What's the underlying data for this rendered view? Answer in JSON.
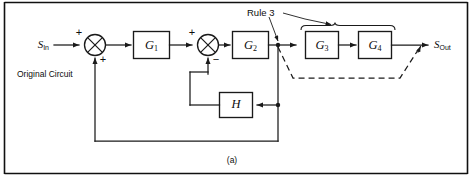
{
  "figure": {
    "caption": "(a)",
    "note": "Original Circuit",
    "annotation": "Rule 3",
    "input_signal": "S",
    "input_signal_sub": "In",
    "output_signal": "S",
    "output_signal_sub": "Out"
  },
  "blocks": [
    {
      "id": "g1",
      "label": "G",
      "sub": "1"
    },
    {
      "id": "g2",
      "label": "G",
      "sub": "2"
    },
    {
      "id": "g3",
      "label": "G",
      "sub": "3"
    },
    {
      "id": "g4",
      "label": "G",
      "sub": "4"
    },
    {
      "id": "h",
      "label": "H",
      "sub": ""
    }
  ],
  "summing_junctions": [
    {
      "id": "sum1",
      "sign_top": "+",
      "sign_bottom": "+"
    },
    {
      "id": "sum2",
      "sign_top": "+",
      "sign_bottom": "−"
    }
  ],
  "colors": {
    "ink": "#1a1a1a",
    "frame": "#101010",
    "background": "#ffffff"
  }
}
